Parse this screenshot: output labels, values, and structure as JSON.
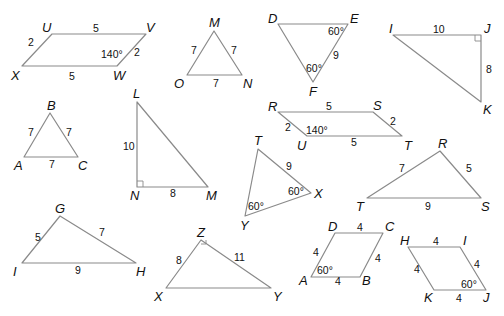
{
  "figure": {
    "width": 504,
    "height": 316,
    "edge_color": "#8a8a8a",
    "text_color": "#111111",
    "background": "#ffffff"
  },
  "shapes": [
    {
      "id": "parallelogram-UVWX",
      "kind": "parallelogram",
      "points": [
        [
          22,
          66
        ],
        [
          52,
          34
        ],
        [
          146,
          34
        ],
        [
          117,
          66
        ]
      ],
      "vertices": [
        {
          "label": "U",
          "x": 42,
          "y": 32
        },
        {
          "label": "V",
          "x": 146,
          "y": 32
        },
        {
          "label": "W",
          "x": 113,
          "y": 80
        },
        {
          "label": "X",
          "x": 11,
          "y": 80
        }
      ],
      "sides": [
        {
          "label": "2",
          "x": 28,
          "y": 46
        },
        {
          "label": "5",
          "x": 93,
          "y": 32
        },
        {
          "label": "2",
          "x": 134,
          "y": 56
        },
        {
          "label": "5",
          "x": 69,
          "y": 80
        }
      ],
      "angles": [
        {
          "label": "140°",
          "x": 101,
          "y": 58
        }
      ],
      "right_angles": []
    },
    {
      "id": "triangle-MNO",
      "kind": "triangle",
      "points": [
        [
          214,
          31
        ],
        [
          187,
          75
        ],
        [
          242,
          75
        ]
      ],
      "vertices": [
        {
          "label": "M",
          "x": 209,
          "y": 27
        },
        {
          "label": "O",
          "x": 174,
          "y": 88
        },
        {
          "label": "N",
          "x": 243,
          "y": 88
        }
      ],
      "sides": [
        {
          "label": "7",
          "x": 191,
          "y": 54
        },
        {
          "label": "7",
          "x": 231,
          "y": 54
        },
        {
          "label": "7",
          "x": 213,
          "y": 87
        }
      ],
      "angles": [],
      "right_angles": []
    },
    {
      "id": "triangle-DEF",
      "kind": "triangle",
      "points": [
        [
          278,
          24
        ],
        [
          348,
          24
        ],
        [
          313,
          82
        ]
      ],
      "vertices": [
        {
          "label": "D",
          "x": 268,
          "y": 23
        },
        {
          "label": "E",
          "x": 350,
          "y": 23
        },
        {
          "label": "F",
          "x": 309,
          "y": 96
        }
      ],
      "sides": [
        {
          "label": "9",
          "x": 333,
          "y": 59
        }
      ],
      "angles": [
        {
          "label": "60°",
          "x": 328,
          "y": 35
        },
        {
          "label": "60°",
          "x": 306,
          "y": 72
        }
      ],
      "right_angles": []
    },
    {
      "id": "triangle-IJK",
      "kind": "triangle",
      "points": [
        [
          393,
          35
        ],
        [
          481,
          35
        ],
        [
          481,
          102
        ]
      ],
      "vertices": [
        {
          "label": "I",
          "x": 389,
          "y": 33
        },
        {
          "label": "J",
          "x": 484,
          "y": 33
        },
        {
          "label": "K",
          "x": 483,
          "y": 114
        }
      ],
      "sides": [
        {
          "label": "10",
          "x": 433,
          "y": 33
        },
        {
          "label": "8",
          "x": 486,
          "y": 73
        }
      ],
      "angles": [],
      "right_angles": [
        {
          "x": 481,
          "y": 35,
          "dx": -6,
          "dy": 6
        }
      ]
    },
    {
      "id": "triangle-ABC",
      "kind": "triangle",
      "points": [
        [
          50,
          113
        ],
        [
          24,
          157
        ],
        [
          78,
          157
        ]
      ],
      "vertices": [
        {
          "label": "B",
          "x": 47,
          "y": 110
        },
        {
          "label": "A",
          "x": 14,
          "y": 170
        },
        {
          "label": "C",
          "x": 78,
          "y": 170
        }
      ],
      "sides": [
        {
          "label": "7",
          "x": 28,
          "y": 136
        },
        {
          "label": "7",
          "x": 66,
          "y": 136
        },
        {
          "label": "7",
          "x": 49,
          "y": 168
        }
      ],
      "angles": [],
      "right_angles": []
    },
    {
      "id": "triangle-LMN",
      "kind": "triangle",
      "points": [
        [
          137,
          102
        ],
        [
          137,
          187
        ],
        [
          208,
          187
        ]
      ],
      "vertices": [
        {
          "label": "L",
          "x": 133,
          "y": 98
        },
        {
          "label": "N",
          "x": 130,
          "y": 200
        },
        {
          "label": "M",
          "x": 206,
          "y": 200
        }
      ],
      "sides": [
        {
          "label": "10",
          "x": 123,
          "y": 150
        },
        {
          "label": "8",
          "x": 170,
          "y": 197
        }
      ],
      "angles": [],
      "right_angles": [
        {
          "x": 137,
          "y": 187,
          "dx": 6,
          "dy": -6
        }
      ]
    },
    {
      "id": "parallelogram-RSTU",
      "kind": "parallelogram",
      "points": [
        [
          278,
          112
        ],
        [
          373,
          112
        ],
        [
          402,
          136
        ],
        [
          307,
          136
        ]
      ],
      "vertices": [
        {
          "label": "R",
          "x": 268,
          "y": 111
        },
        {
          "label": "S",
          "x": 373,
          "y": 110
        },
        {
          "label": "T",
          "x": 404,
          "y": 150
        },
        {
          "label": "U",
          "x": 297,
          "y": 150
        }
      ],
      "sides": [
        {
          "label": "5",
          "x": 326,
          "y": 110
        },
        {
          "label": "2",
          "x": 285,
          "y": 131
        },
        {
          "label": "2",
          "x": 390,
          "y": 125
        },
        {
          "label": "5",
          "x": 351,
          "y": 146
        }
      ],
      "angles": [
        {
          "label": "140°",
          "x": 306,
          "y": 134
        }
      ],
      "right_angles": []
    },
    {
      "id": "triangle-TXY",
      "kind": "triangle",
      "points": [
        [
          258,
          149
        ],
        [
          311,
          193
        ],
        [
          245,
          216
        ]
      ],
      "vertices": [
        {
          "label": "T",
          "x": 254,
          "y": 145
        },
        {
          "label": "X",
          "x": 314,
          "y": 198
        },
        {
          "label": "Y",
          "x": 240,
          "y": 230
        }
      ],
      "sides": [
        {
          "label": "9",
          "x": 286,
          "y": 170
        }
      ],
      "angles": [
        {
          "label": "60°",
          "x": 288,
          "y": 195
        },
        {
          "label": "60°",
          "x": 248,
          "y": 210
        }
      ],
      "right_angles": []
    },
    {
      "id": "triangle-RST",
      "kind": "triangle",
      "points": [
        [
          440,
          151
        ],
        [
          367,
          198
        ],
        [
          481,
          198
        ]
      ],
      "vertices": [
        {
          "label": "R",
          "x": 438,
          "y": 148
        },
        {
          "label": "T",
          "x": 356,
          "y": 211
        },
        {
          "label": "S",
          "x": 481,
          "y": 211
        }
      ],
      "sides": [
        {
          "label": "7",
          "x": 399,
          "y": 172
        },
        {
          "label": "5",
          "x": 466,
          "y": 172
        },
        {
          "label": "9",
          "x": 425,
          "y": 210
        }
      ],
      "angles": [],
      "right_angles": []
    },
    {
      "id": "triangle-GHI",
      "kind": "triangle",
      "points": [
        [
          60,
          216
        ],
        [
          22,
          263
        ],
        [
          136,
          263
        ]
      ],
      "vertices": [
        {
          "label": "G",
          "x": 55,
          "y": 213
        },
        {
          "label": "I",
          "x": 13,
          "y": 276
        },
        {
          "label": "H",
          "x": 136,
          "y": 276
        }
      ],
      "sides": [
        {
          "label": "5",
          "x": 35,
          "y": 241
        },
        {
          "label": "7",
          "x": 99,
          "y": 236
        },
        {
          "label": "9",
          "x": 75,
          "y": 274
        }
      ],
      "angles": [],
      "right_angles": []
    },
    {
      "id": "triangle-XYZ",
      "kind": "triangle",
      "points": [
        [
          201,
          240
        ],
        [
          166,
          288
        ],
        [
          271,
          288
        ]
      ],
      "vertices": [
        {
          "label": "Z",
          "x": 197,
          "y": 237
        },
        {
          "label": "X",
          "x": 154,
          "y": 301
        },
        {
          "label": "Y",
          "x": 273,
          "y": 301
        }
      ],
      "sides": [
        {
          "label": "8",
          "x": 176,
          "y": 264
        },
        {
          "label": "11",
          "x": 234,
          "y": 261
        }
      ],
      "angles": [],
      "right_angles": [
        {
          "x": 201,
          "y": 240,
          "dx": 5,
          "dy": 4
        }
      ]
    },
    {
      "id": "rhombus-ABCD",
      "kind": "rhombus",
      "points": [
        [
          311,
          277
        ],
        [
          335,
          233
        ],
        [
          383,
          233
        ],
        [
          360,
          277
        ]
      ],
      "vertices": [
        {
          "label": "D",
          "x": 328,
          "y": 231
        },
        {
          "label": "C",
          "x": 385,
          "y": 231
        },
        {
          "label": "A",
          "x": 299,
          "y": 285
        },
        {
          "label": "B",
          "x": 362,
          "y": 285
        }
      ],
      "sides": [
        {
          "label": "4",
          "x": 357,
          "y": 231
        },
        {
          "label": "4",
          "x": 313,
          "y": 256
        },
        {
          "label": "4",
          "x": 375,
          "y": 262
        },
        {
          "label": "4",
          "x": 335,
          "y": 285
        }
      ],
      "angles": [
        {
          "label": "60°",
          "x": 317,
          "y": 274
        }
      ],
      "right_angles": []
    },
    {
      "id": "rhombus-HIJK",
      "kind": "rhombus",
      "points": [
        [
          408,
          247
        ],
        [
          460,
          247
        ],
        [
          486,
          290
        ],
        [
          434,
          290
        ]
      ],
      "vertices": [
        {
          "label": "H",
          "x": 400,
          "y": 245
        },
        {
          "label": "I",
          "x": 463,
          "y": 245
        },
        {
          "label": "K",
          "x": 424,
          "y": 302
        },
        {
          "label": "J",
          "x": 483,
          "y": 302
        }
      ],
      "sides": [
        {
          "label": "4",
          "x": 433,
          "y": 245
        },
        {
          "label": "4",
          "x": 414,
          "y": 273
        },
        {
          "label": "4",
          "x": 474,
          "y": 268
        },
        {
          "label": "4",
          "x": 456,
          "y": 302
        }
      ],
      "angles": [
        {
          "label": "60°",
          "x": 461,
          "y": 288
        }
      ],
      "right_angles": []
    }
  ]
}
